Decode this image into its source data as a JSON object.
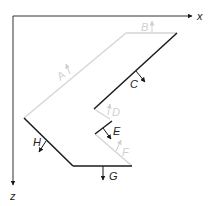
{
  "diagram": {
    "type": "plate-cross-section",
    "colors": {
      "axis": "#333333",
      "dark_edge": "#1a1a1a",
      "light_edge": "#d4d4d4",
      "light_label": "#cfcfcf",
      "dark_label": "#222222"
    },
    "axes": {
      "x_label": "x",
      "z_label": "z"
    },
    "edges": [
      {
        "id": "A",
        "label": "A",
        "style": "light",
        "normal": "outward-up-left"
      },
      {
        "id": "B",
        "label": "B",
        "style": "light",
        "normal": "up"
      },
      {
        "id": "C",
        "label": "C",
        "style": "dark",
        "normal": "down-right"
      },
      {
        "id": "D",
        "label": "D",
        "style": "light",
        "normal": "up-right"
      },
      {
        "id": "E",
        "label": "E",
        "style": "dark",
        "normal": "down-right"
      },
      {
        "id": "F",
        "label": "F",
        "style": "light",
        "normal": "up-right"
      },
      {
        "id": "G",
        "label": "G",
        "style": "dark",
        "normal": "down"
      },
      {
        "id": "H",
        "label": "H",
        "style": "dark",
        "normal": "down-left"
      }
    ]
  }
}
